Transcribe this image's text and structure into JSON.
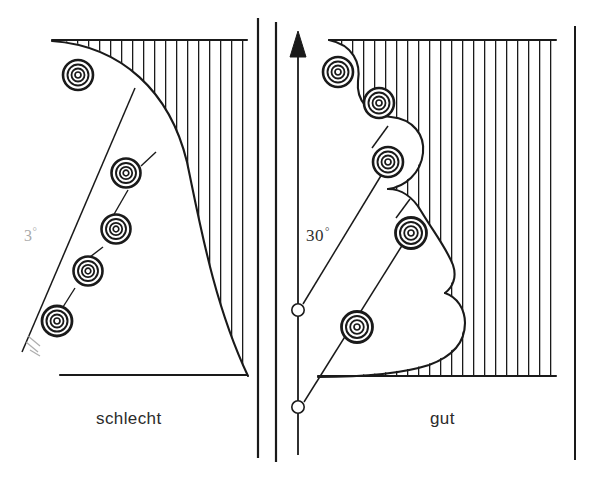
{
  "figure": {
    "background_color": "#ffffff",
    "ink_color": "#1a1a1a",
    "width": 602,
    "height": 483
  },
  "panels": [
    {
      "id": "left",
      "label": "schlecht",
      "label_position": {
        "x": 96,
        "y": 409
      },
      "angle_label": {
        "value": "3",
        "degree_symbol": "°",
        "faded": true
      },
      "workpiece": {
        "hatching": "vertical",
        "boundary": "single-concave-arc",
        "hatch_spacing_px": 11,
        "top_edge_y": 40,
        "bottom_edge_y": 375,
        "right_edge_x": 247
      },
      "tool_positions": [
        {
          "index": 1,
          "x": 78,
          "y": 75,
          "r": 15
        },
        {
          "index": 2,
          "x": 126,
          "y": 173,
          "r": 14
        },
        {
          "index": 3,
          "x": 115,
          "y": 230,
          "r": 14
        },
        {
          "index": 4,
          "x": 88,
          "y": 270,
          "r": 14
        },
        {
          "index": 5,
          "x": 56,
          "y": 321,
          "r": 15
        }
      ],
      "feed_line": {
        "angle_deg": 30,
        "style": "solid"
      }
    },
    {
      "id": "right",
      "label": "gut",
      "label_position": {
        "x": 430,
        "y": 409
      },
      "angle_label": {
        "value": "30",
        "degree_symbol": "°",
        "faded": false
      },
      "axis": {
        "type": "vertical-arrow",
        "x": 298,
        "top_y": 36,
        "bottom_y": 455,
        "arrowhead": "solid-triangle-up",
        "pivot_markers": [
          {
            "x": 298,
            "y": 310,
            "r": 6,
            "fill": "none"
          },
          {
            "x": 298,
            "y": 407,
            "r": 6,
            "fill": "none"
          }
        ]
      },
      "workpiece": {
        "hatching": "vertical",
        "boundary": "scalloped-stepped",
        "hatch_spacing_px": 11,
        "top_edge_y": 40,
        "bottom_edge_y": 375,
        "right_edge_x": 556,
        "scallop_count": 5
      },
      "tool_positions": [
        {
          "index": 1,
          "x": 338,
          "y": 72,
          "r": 15
        },
        {
          "index": 2,
          "x": 379,
          "y": 103,
          "r": 15
        },
        {
          "index": 3,
          "x": 388,
          "y": 162,
          "r": 15
        },
        {
          "index": 4,
          "x": 410,
          "y": 233,
          "r": 15
        },
        {
          "index": 5,
          "x": 357,
          "y": 327,
          "r": 15
        }
      ],
      "feed_lines": [
        {
          "from": {
            "x": 298,
            "y": 310
          },
          "to": {
            "x": 388,
            "y": 162
          },
          "angle_deg": 30
        },
        {
          "from": {
            "x": 298,
            "y": 407
          },
          "to": {
            "x": 410,
            "y": 233
          },
          "angle_deg": 30
        }
      ]
    }
  ],
  "frame": {
    "divider_x": 258,
    "divider_top_y": 18,
    "divider_bottom_y": 458,
    "right_panel_left_x": 275,
    "right_panel_left_top_y": 22,
    "right_panel_left_bottom_y": 462,
    "right_border_x": 575,
    "right_border_top_y": 26,
    "right_border_bottom_y": 460
  },
  "tool_symbol": {
    "name": "concentric-circles",
    "ring_count": 4,
    "description": "Werkzeug / Fraeser im Querschnitt"
  }
}
